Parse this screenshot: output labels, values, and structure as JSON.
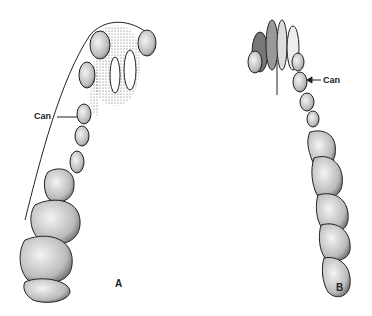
{
  "figure": {
    "panels": [
      {
        "id": "A",
        "label": "A",
        "annotation": "Can"
      },
      {
        "id": "B",
        "label": "B",
        "annotation": "Can"
      }
    ],
    "colors": {
      "outline": "#222222",
      "shade": "#555555",
      "background": "#ffffff"
    }
  }
}
